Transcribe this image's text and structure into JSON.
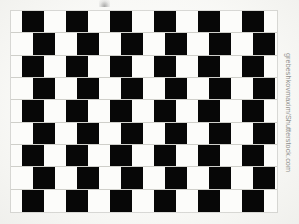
{
  "image": {
    "title": "Cafe Wall Optical Illusion",
    "subject": "cafe-wall-illusion",
    "background_color": "#fbfbf9"
  },
  "credit": {
    "text": "grebeshkovmaxim/Shutterstock.com",
    "color": "#8f8f8c",
    "orientation": "rotated-90-clockwise"
  },
  "pattern": {
    "name": "cafe-wall",
    "tile_black_color": "#070707",
    "tile_white_color": "#fcfcfa",
    "mortar_color": "#cfcfca",
    "rows": 9,
    "tiles_per_row": 15,
    "tile_width_px": 22,
    "row_height_px": 22,
    "row_offsets_px": [
      -11,
      0,
      -11,
      -22,
      -11,
      0,
      -11,
      -22,
      -11
    ],
    "row_start_color": [
      "white",
      "white",
      "white",
      "black",
      "white",
      "white",
      "white",
      "black",
      "white"
    ]
  },
  "artifact": {
    "name": "scan-smudge",
    "description": "faint dark smudge at top centre"
  }
}
